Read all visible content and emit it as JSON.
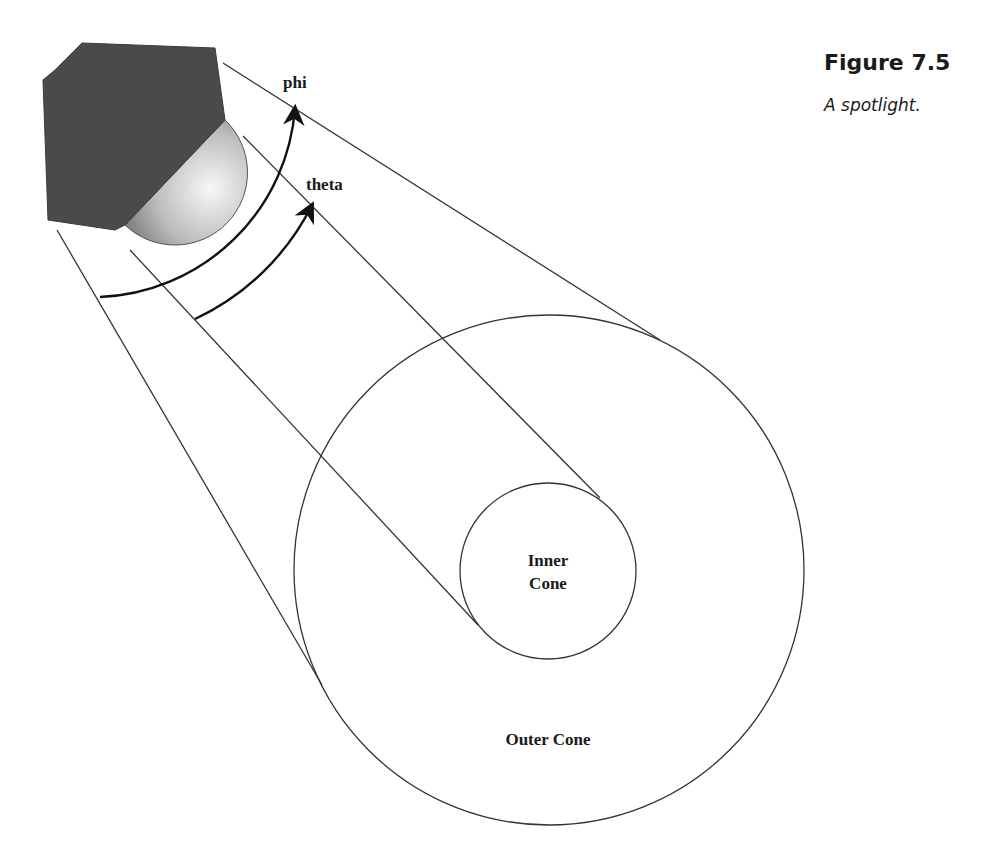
{
  "figure": {
    "number": "Figure 7.5",
    "caption": "A spotlight."
  },
  "labels": {
    "phi": "phi",
    "theta": "theta",
    "inner_cone_line1": "Inner",
    "inner_cone_line2": "Cone",
    "outer_cone": "Outer Cone"
  },
  "colors": {
    "housing": "#4a4a4a",
    "bulb_light": "#f4f4f4",
    "bulb_dark": "#8a8a8a",
    "line": "#333333",
    "arrow": "#111111",
    "text": "#1a1a1a"
  },
  "geometry": {
    "light_source": {
      "center": [
        90,
        95
      ]
    },
    "phi_arc": {
      "radius": 204,
      "start": [
        100,
        297
      ],
      "end": [
        295,
        108
      ]
    },
    "theta_arc": {
      "radius": 248,
      "start": [
        195,
        319
      ],
      "end": [
        312,
        205
      ]
    },
    "outer_cone_circle": {
      "cx": 549,
      "cy": 570,
      "r": 255
    },
    "inner_cone_circle": {
      "cx": 548,
      "cy": 571,
      "r": 88
    }
  }
}
